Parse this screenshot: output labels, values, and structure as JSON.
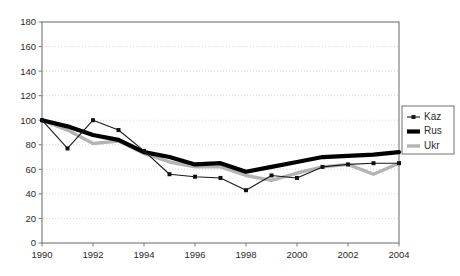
{
  "chart_data": {
    "type": "line",
    "title": "",
    "subtitle": "",
    "xlabel": "",
    "ylabel": "",
    "xlim": [
      1990,
      2004
    ],
    "ylim": [
      0,
      180
    ],
    "ytick_step": 20,
    "xtick_step": 2,
    "grid": true,
    "grid_orientation": "horizontal",
    "legend_position": "right",
    "x": [
      1990,
      1991,
      1992,
      1993,
      1994,
      1995,
      1996,
      1997,
      1998,
      1999,
      2000,
      2001,
      2002,
      2003,
      2004
    ],
    "xtick_labels": [
      "1990",
      "1992",
      "1994",
      "1996",
      "1998",
      "2000",
      "2002",
      "2004"
    ],
    "xtick_values": [
      1990,
      1992,
      1994,
      1996,
      1998,
      2000,
      2002,
      2004
    ],
    "ytick_labels": [
      "0",
      "20",
      "40",
      "60",
      "80",
      "100",
      "120",
      "140",
      "160",
      "180"
    ],
    "ytick_values": [
      0,
      20,
      40,
      60,
      80,
      100,
      120,
      140,
      160,
      180
    ],
    "series": [
      {
        "name": "Kaz",
        "color": "#1a1a1a",
        "style": "thin-line-with-markers",
        "markers": true,
        "values": [
          100,
          77,
          100,
          92,
          75,
          56,
          54,
          53,
          43,
          55,
          53,
          62,
          64,
          65,
          65
        ]
      },
      {
        "name": "Rus",
        "color": "#000000",
        "style": "thick-line",
        "markers": false,
        "values": [
          100,
          95,
          88,
          84,
          74,
          70,
          64,
          65,
          58,
          62,
          66,
          70,
          71,
          72,
          74
        ]
      },
      {
        "name": "Ukr",
        "color": "#b4b4b4",
        "style": "thick-gray-line",
        "markers": false,
        "values": [
          100,
          92,
          81,
          83,
          73,
          66,
          62,
          62,
          55,
          51,
          57,
          62,
          64,
          56,
          65
        ]
      }
    ]
  },
  "legend": {
    "entries": [
      {
        "label": "Kaz",
        "swatch": "kaz-line-marker-swatch"
      },
      {
        "label": "Rus",
        "swatch": "rus-thick-line-swatch"
      },
      {
        "label": "Ukr",
        "swatch": "ukr-gray-line-swatch"
      }
    ]
  },
  "colors": {
    "background": "#ffffff",
    "frame": "#808080",
    "grid": "#c9c9c9",
    "text": "#2b2b2b",
    "kaz": "#1a1a1a",
    "rus": "#000000",
    "ukr": "#b4b4b4"
  }
}
